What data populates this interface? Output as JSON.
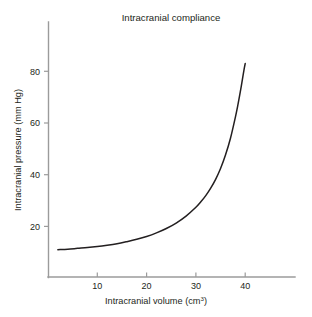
{
  "figure": {
    "background_color": "#ffffff",
    "title": "Intracranial compliance"
  },
  "chart_data": {
    "type": "line",
    "title": "Intracranial compliance",
    "xlabel": "Intracranial volume (cm",
    "xlabel_superscript": "3",
    "xlabel_suffix": ")",
    "xlabel_full": "Intracranial volume (cm3)",
    "ylabel": "Intracranial pressure (mm Hg)",
    "xlim": [
      0,
      50
    ],
    "ylim": [
      0,
      90
    ],
    "xticks": [
      10,
      20,
      30,
      40
    ],
    "xticklabels": [
      "10",
      "20",
      "30",
      "40"
    ],
    "yticks": [
      20,
      40,
      60,
      80
    ],
    "yticklabels": [
      "20",
      "40",
      "60",
      "80"
    ],
    "grid": false,
    "legend": false,
    "line_color": "#231f20",
    "axis_color": "#9b9b9b",
    "series": [
      {
        "name": "Pressure-volume curve",
        "x": [
          2.0,
          4.0,
          6.0,
          8.0,
          10.0,
          12.0,
          14.0,
          16.0,
          18.0,
          20.0,
          22.0,
          24.0,
          26.0,
          28.0,
          30.0,
          31.0,
          32.0,
          33.0,
          34.0,
          35.0,
          36.0,
          37.0,
          38.0,
          38.5,
          39.0,
          39.3,
          39.6,
          39.8,
          40.0
        ],
        "y": [
          11.0,
          11.2,
          11.5,
          11.8,
          12.2,
          12.7,
          13.3,
          14.1,
          15.0,
          16.1,
          17.5,
          19.2,
          21.3,
          24.0,
          27.4,
          29.5,
          31.9,
          34.8,
          38.2,
          42.4,
          47.6,
          54.0,
          62.2,
          66.8,
          72.0,
          75.3,
          78.8,
          81.0,
          83.0
        ]
      }
    ]
  }
}
